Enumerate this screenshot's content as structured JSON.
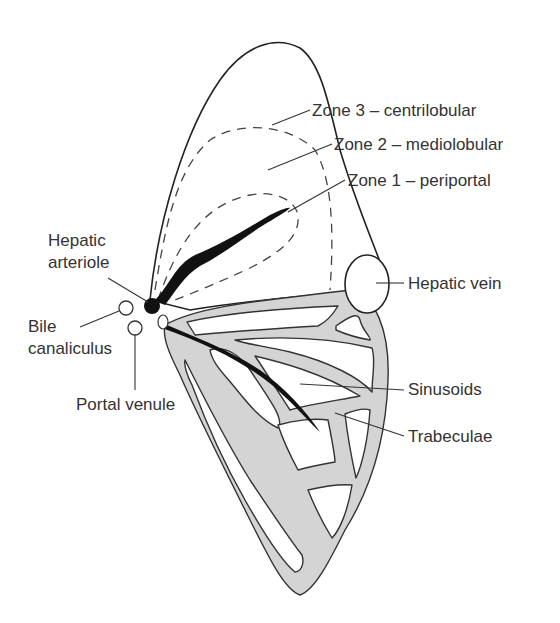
{
  "diagram": {
    "labels": {
      "zone3": "Zone 3 – centrilobular",
      "zone2": "Zone 2 – mediolobular",
      "zone1": "Zone 1 – periportal",
      "hepatic_arteriole_line1": "Hepatic",
      "hepatic_arteriole_line2": "arteriole",
      "bile_canaliculus_line1": "Bile",
      "bile_canaliculus_line2": "canaliculus",
      "portal_venule": "Portal venule",
      "hepatic_vein": "Hepatic vein",
      "sinusoids": "Sinusoids",
      "trabeculae": "Trabeculae"
    },
    "colors": {
      "trabeculae_fill": "#d4d4d4",
      "outline": "#222222",
      "arteriole": "#111111",
      "text": "#333333"
    }
  }
}
